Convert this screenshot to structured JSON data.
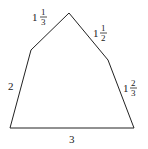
{
  "diagram": {
    "shape": "pentagon",
    "stroke_color": "#222222",
    "vertices": [
      [
        10,
        128
      ],
      [
        134,
        128
      ],
      [
        108,
        60
      ],
      [
        69,
        13
      ],
      [
        31,
        50
      ]
    ],
    "sides": [
      {
        "name": "bottom",
        "whole": "3",
        "num": "",
        "den": ""
      },
      {
        "name": "right",
        "whole": "1",
        "num": "2",
        "den": "3"
      },
      {
        "name": "upper-right",
        "whole": "1",
        "num": "1",
        "den": "2"
      },
      {
        "name": "upper-left",
        "whole": "1",
        "num": "1",
        "den": "3"
      },
      {
        "name": "left",
        "whole": "2",
        "num": "",
        "den": ""
      }
    ]
  }
}
